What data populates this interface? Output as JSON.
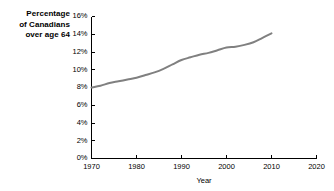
{
  "figure": {
    "width": 334,
    "height": 191,
    "background": "#ffffff"
  },
  "axis_title": {
    "line1": "Percentage",
    "line2": "of Canadians",
    "line3": "over age 64"
  },
  "chart_data": {
    "type": "line",
    "title": "",
    "xlabel": "Year",
    "ylabel": "Percentage of Canadians over age 64",
    "xlim": [
      1970,
      2020
    ],
    "ylim": [
      0,
      16
    ],
    "grid": false,
    "legend": null,
    "line_color": "#808080",
    "axis_color": "#000000",
    "xticks": [
      1970,
      1980,
      1990,
      2000,
      2010,
      2020
    ],
    "xtick_labels": [
      "1970",
      "1980",
      "1990",
      "2000",
      "2010",
      "2020"
    ],
    "yticks": [
      0,
      2,
      4,
      6,
      8,
      10,
      12,
      14,
      16
    ],
    "ytick_labels": [
      "0%",
      "2%",
      "4%",
      "6%",
      "8%",
      "10%",
      "12%",
      "14%",
      "16%"
    ],
    "x": [
      1970,
      1972,
      1974,
      1976,
      1978,
      1980,
      1982,
      1984,
      1986,
      1988,
      1990,
      1992,
      1994,
      1996,
      1998,
      2000,
      2002,
      2004,
      2006,
      2008,
      2010
    ],
    "values": [
      8.0,
      8.2,
      8.5,
      8.7,
      8.9,
      9.1,
      9.4,
      9.7,
      10.1,
      10.6,
      11.1,
      11.4,
      11.7,
      11.9,
      12.2,
      12.5,
      12.6,
      12.8,
      13.1,
      13.6,
      14.1
    ],
    "series": [
      {
        "name": "Percentage of Canadians over age 64",
        "values": [
          8.0,
          8.2,
          8.5,
          8.7,
          8.9,
          9.1,
          9.4,
          9.7,
          10.1,
          10.6,
          11.1,
          11.4,
          11.7,
          11.9,
          12.2,
          12.5,
          12.6,
          12.8,
          13.1,
          13.6,
          14.1
        ]
      }
    ]
  }
}
